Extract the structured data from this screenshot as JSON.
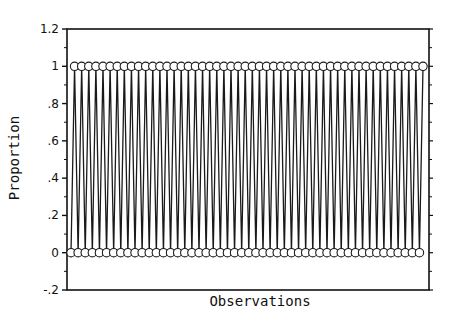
{
  "chart_data": {
    "type": "line",
    "title": "",
    "xlabel": "Observations",
    "ylabel": "Proportion",
    "ylim": [
      -0.2,
      1.2
    ],
    "yticks": [
      "-.2",
      "0",
      ".2",
      ".4",
      ".6",
      ".8",
      "1",
      "1.2"
    ],
    "ytick_values": [
      -0.2,
      0,
      0.2,
      0.4,
      0.6,
      0.8,
      1.0,
      1.2
    ],
    "xticks": [],
    "grid": false,
    "legend": null,
    "marker": "open-circle",
    "n_observations": 100,
    "pattern": "alternating 0,1 starting at 0",
    "series": [
      {
        "name": "Proportion",
        "x": [
          1,
          2,
          3,
          4,
          5,
          6,
          7,
          8,
          9,
          10,
          11,
          12,
          13,
          14,
          15,
          16,
          17,
          18,
          19,
          20,
          21,
          22,
          23,
          24,
          25,
          26,
          27,
          28,
          29,
          30,
          31,
          32,
          33,
          34,
          35,
          36,
          37,
          38,
          39,
          40,
          41,
          42,
          43,
          44,
          45,
          46,
          47,
          48,
          49,
          50,
          51,
          52,
          53,
          54,
          55,
          56,
          57,
          58,
          59,
          60,
          61,
          62,
          63,
          64,
          65,
          66,
          67,
          68,
          69,
          70,
          71,
          72,
          73,
          74,
          75,
          76,
          77,
          78,
          79,
          80,
          81,
          82,
          83,
          84,
          85,
          86,
          87,
          88,
          89,
          90,
          91,
          92,
          93,
          94,
          95,
          96,
          97,
          98,
          99,
          100
        ],
        "values": [
          0,
          1,
          0,
          1,
          0,
          1,
          0,
          1,
          0,
          1,
          0,
          1,
          0,
          1,
          0,
          1,
          0,
          1,
          0,
          1,
          0,
          1,
          0,
          1,
          0,
          1,
          0,
          1,
          0,
          1,
          0,
          1,
          0,
          1,
          0,
          1,
          0,
          1,
          0,
          1,
          0,
          1,
          0,
          1,
          0,
          1,
          0,
          1,
          0,
          1,
          0,
          1,
          0,
          1,
          0,
          1,
          0,
          1,
          0,
          1,
          0,
          1,
          0,
          1,
          0,
          1,
          0,
          1,
          0,
          1,
          0,
          1,
          0,
          1,
          0,
          1,
          0,
          1,
          0,
          1,
          0,
          1,
          0,
          1,
          0,
          1,
          0,
          1,
          0,
          1,
          0,
          1,
          0,
          1,
          0,
          1,
          0,
          1,
          0,
          1
        ]
      }
    ]
  },
  "labels": {
    "xlabel": "Observations",
    "ylabel": "Proportion"
  }
}
